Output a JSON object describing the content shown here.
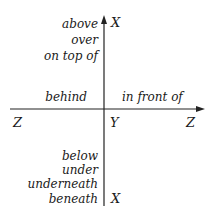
{
  "diagram": {
    "vertical_axis": {
      "top_label": "X",
      "bottom_label": "X"
    },
    "horizontal_axis": {
      "left_label": "Z",
      "right_label": "Z"
    },
    "origin_label": "Y",
    "upper_words": [
      "above",
      "over",
      "on top of"
    ],
    "left_word": "behind",
    "right_word": "in front of",
    "lower_words": [
      "below",
      "under",
      "underneath",
      "beneath"
    ]
  }
}
